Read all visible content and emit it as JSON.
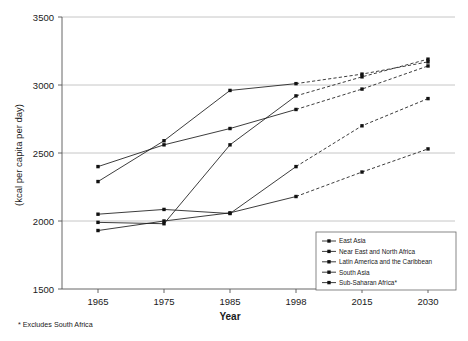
{
  "chart_data": {
    "type": "line",
    "title": "",
    "xlabel": "Year",
    "ylabel": "(kcal per capita per day)",
    "x": [
      "1965",
      "1975",
      "1985",
      "1998",
      "2015",
      "2030"
    ],
    "xlim": [
      0,
      5
    ],
    "ylim": [
      1500,
      3500
    ],
    "yticks": [
      "1500",
      "2000",
      "2500",
      "3000",
      "3500"
    ],
    "grid": true,
    "legend_position": "bottom-right",
    "projection_starts_at": "1998",
    "footnote": "* Excludes South Africa",
    "series": [
      {
        "name": "East Asia",
        "values": [
          1990,
          1980,
          2560,
          2920,
          3060,
          3190
        ],
        "marker": "square"
      },
      {
        "name": "Near East and North Africa",
        "values": [
          2290,
          2590,
          2960,
          3010,
          3080,
          3170
        ],
        "marker": "square"
      },
      {
        "name": "Latin America and the Caribbean",
        "values": [
          2400,
          2560,
          2680,
          2820,
          2970,
          3140
        ],
        "marker": "square"
      },
      {
        "name": "South Asia",
        "values": [
          2050,
          2085,
          2055,
          2400,
          2700,
          2900
        ],
        "marker": "square"
      },
      {
        "name": "Sub-Saharan Africa*",
        "values": [
          1930,
          2000,
          2060,
          2180,
          2360,
          2530
        ],
        "marker": "square"
      }
    ]
  },
  "legend": {
    "items": [
      "East Asia",
      "Near East and North Africa",
      "Latin America and the Caribbean",
      "South Asia",
      "Sub-Saharan Africa*"
    ]
  },
  "colors": {
    "line": "#1a1a1a",
    "grid": "#b8b8b8",
    "axis": "#555555",
    "background": "#ffffff"
  }
}
